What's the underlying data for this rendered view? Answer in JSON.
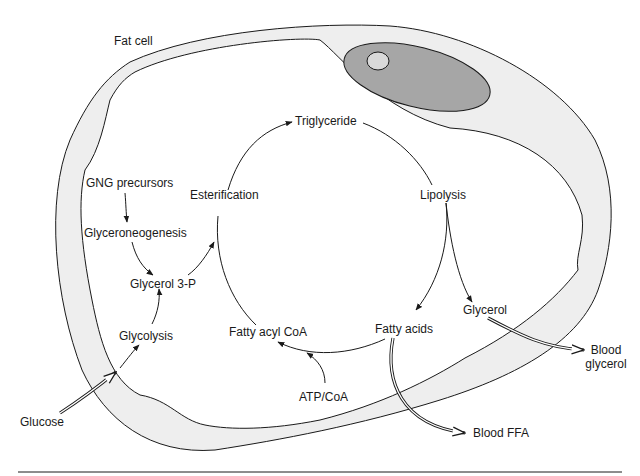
{
  "diagram": {
    "cell_label": "Fat cell",
    "nodes": {
      "triglyceride": "Triglyceride",
      "esterification": "Esterification",
      "lipolysis": "Lipolysis",
      "gng_precursors": "GNG precursors",
      "glyceroneogenesis": "Glyceroneogenesis",
      "glycerol_3p": "Glycerol 3-P",
      "glycolysis": "Glycolysis",
      "glucose": "Glucose",
      "fatty_acyl_coa": "Fatty acyl CoA",
      "atp_coa": "ATP/CoA",
      "fatty_acids": "Fatty acids",
      "glycerol": "Glycerol",
      "blood_glycerol_line1": "Blood",
      "blood_glycerol_line2": "glycerol",
      "blood_ffa": "Blood FFA"
    },
    "colors": {
      "stroke": "#1a1a1a",
      "membrane_fill": "#eeeeee",
      "nucleus_fill": "#a6a6a6",
      "nucleolus_fill": "#d9d9d9"
    }
  }
}
